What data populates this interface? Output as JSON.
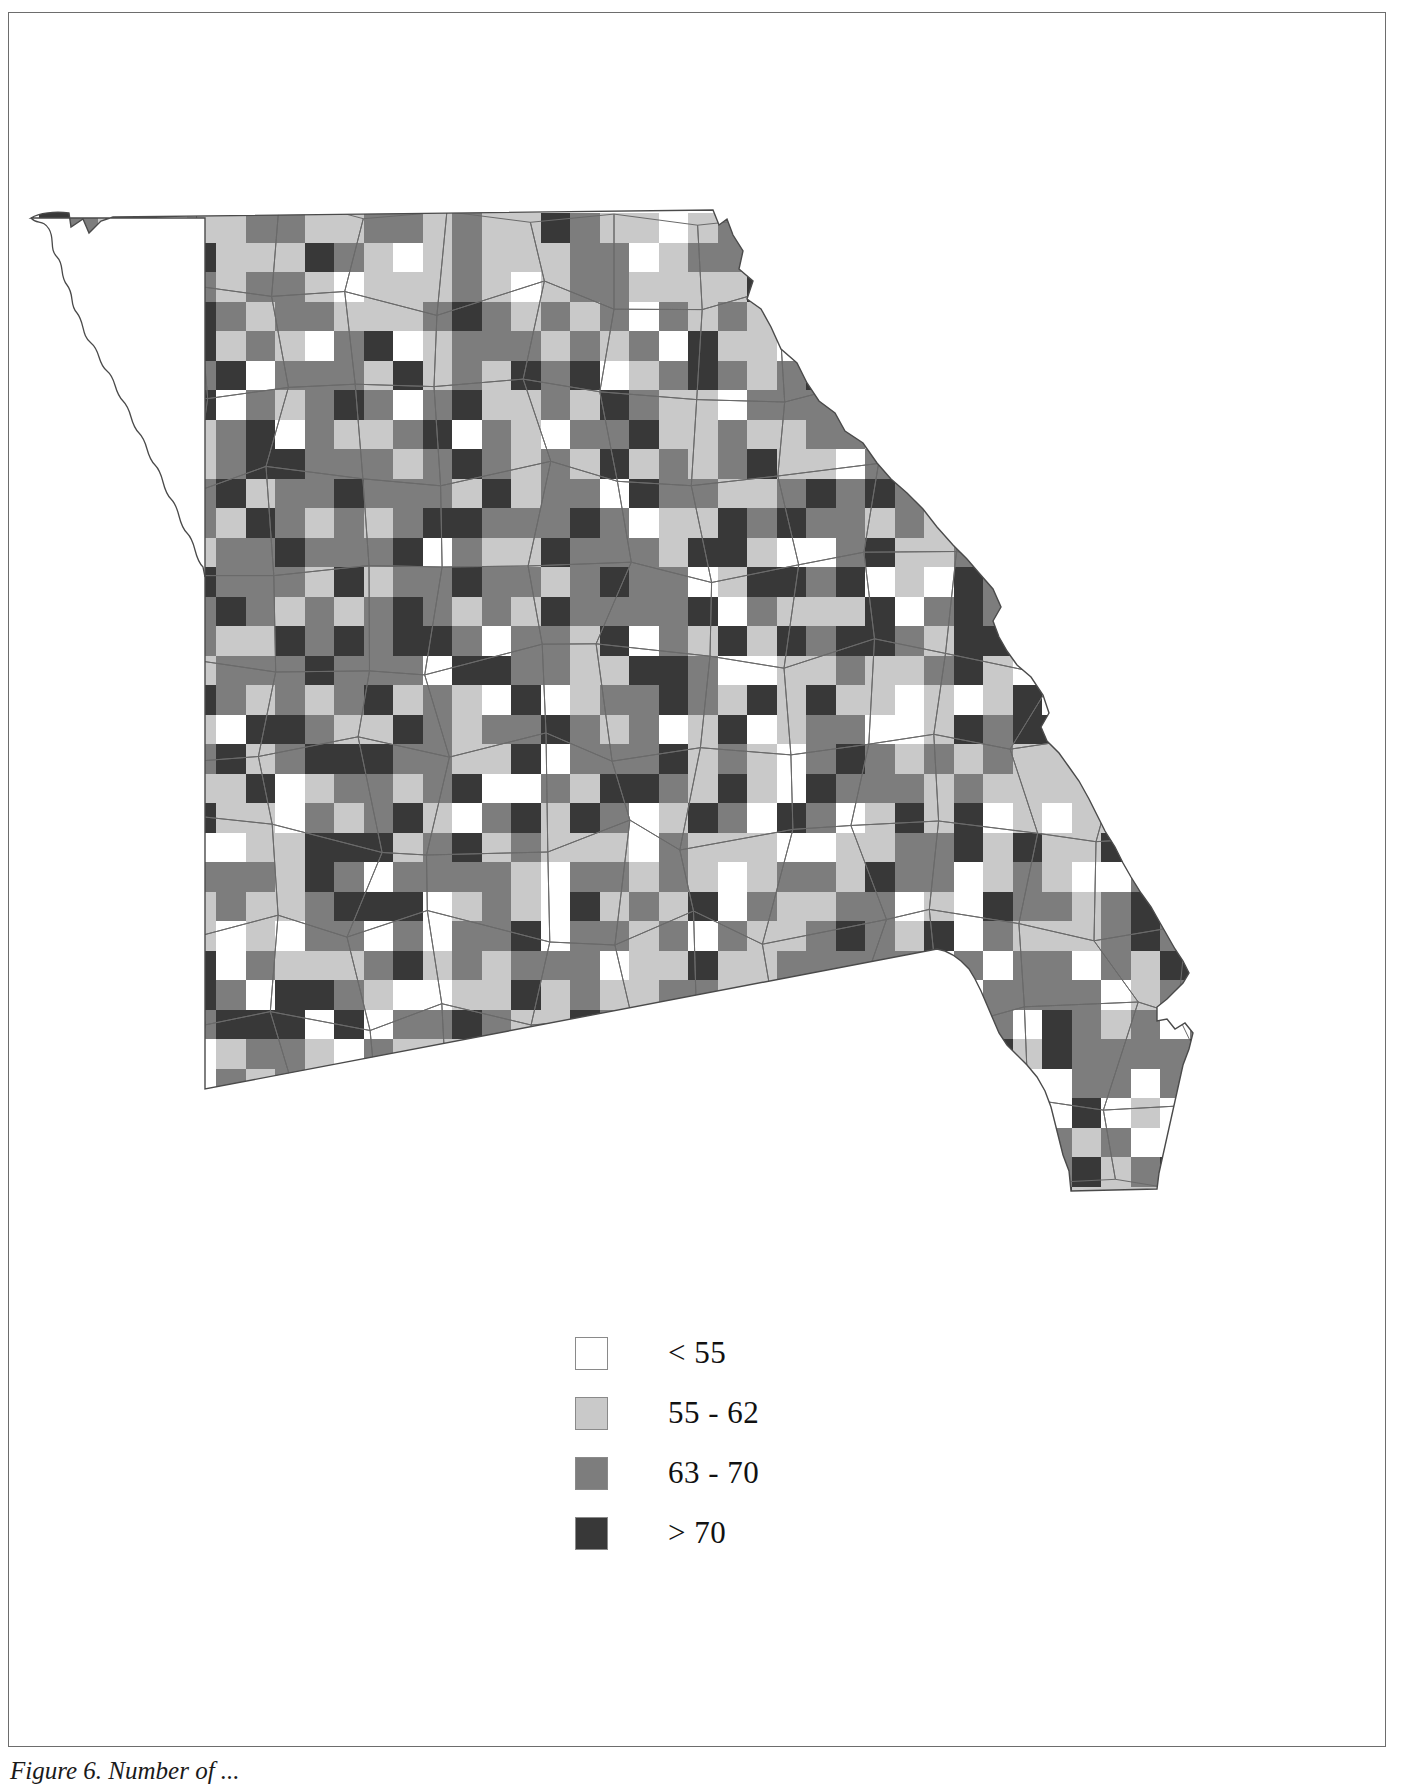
{
  "figure": {
    "caption": "Figure 6. Number of ...",
    "kind": "choropleth-grid-map",
    "region": "Missouri"
  },
  "legend": {
    "title": "",
    "items": [
      {
        "label": "< 55",
        "color": "#ffffff",
        "swatch_name": "legend-swatch-lt55"
      },
      {
        "label": "55 - 62",
        "color": "#c9c9c9",
        "swatch_name": "legend-swatch-55-62"
      },
      {
        "label": "63 - 70",
        "color": "#7d7d7d",
        "swatch_name": "legend-swatch-63-70"
      },
      {
        "label": "> 70",
        "color": "#383838",
        "swatch_name": "legend-swatch-gt70"
      }
    ]
  },
  "chart_data": {
    "type": "heatmap",
    "title": "",
    "xlabel": "",
    "ylabel": "",
    "grid": true,
    "legend_position": "bottom-center",
    "class_colors": [
      "#ffffff",
      "#c9c9c9",
      "#7d7d7d",
      "#383838"
    ],
    "class_labels": [
      "< 55",
      "55 - 62",
      "63 - 70",
      "> 70"
    ],
    "cell_size_px": 29.5,
    "origin_px": [
      30,
      200
    ],
    "note": "Each grid cell is classified into one of four value bins shown in the legend.",
    "cells": [
      {
        "r": 0,
        "c": 2,
        "v": 1
      },
      {
        "r": 0,
        "c": 3,
        "v": 1
      },
      {
        "r": 0,
        "c": 5,
        "v": 1
      },
      {
        "r": 0,
        "c": 7,
        "v": 2
      },
      {
        "r": 0,
        "c": 9,
        "v": 1
      },
      {
        "r": 0,
        "c": 10,
        "v": 1
      },
      {
        "r": 0,
        "c": 12,
        "v": 2
      },
      {
        "r": 0,
        "c": 13,
        "v": 1
      },
      {
        "r": 0,
        "c": 15,
        "v": 1
      },
      {
        "r": 0,
        "c": 16,
        "v": 1
      },
      {
        "r": 0,
        "c": 18,
        "v": 2
      },
      {
        "r": 0,
        "c": 19,
        "v": 1
      },
      {
        "r": 0,
        "c": 20,
        "v": 1
      },
      {
        "r": 0,
        "c": 22,
        "v": 1
      },
      {
        "r": 1,
        "c": 1,
        "v": 1
      },
      {
        "r": 1,
        "c": 2,
        "v": 1
      },
      {
        "r": 1,
        "c": 3,
        "v": 2
      },
      {
        "r": 1,
        "c": 4,
        "v": 1
      },
      {
        "r": 1,
        "c": 6,
        "v": 1
      },
      {
        "r": 1,
        "c": 7,
        "v": 1
      },
      {
        "r": 1,
        "c": 8,
        "v": 1
      },
      {
        "r": 1,
        "c": 10,
        "v": 2
      },
      {
        "r": 1,
        "c": 11,
        "v": 1
      },
      {
        "r": 1,
        "c": 13,
        "v": 1
      },
      {
        "r": 1,
        "c": 14,
        "v": 2
      },
      {
        "r": 1,
        "c": 16,
        "v": 1
      },
      {
        "r": 1,
        "c": 17,
        "v": 1
      },
      {
        "r": 1,
        "c": 19,
        "v": 2
      },
      {
        "r": 1,
        "c": 21,
        "v": 1
      },
      {
        "r": 1,
        "c": 23,
        "v": 2
      },
      {
        "r": 2,
        "c": 1,
        "v": 1
      },
      {
        "r": 2,
        "c": 2,
        "v": 2
      },
      {
        "r": 2,
        "c": 4,
        "v": 1
      },
      {
        "r": 2,
        "c": 5,
        "v": 2
      },
      {
        "r": 2,
        "c": 6,
        "v": 1
      },
      {
        "r": 2,
        "c": 8,
        "v": 2
      },
      {
        "r": 2,
        "c": 9,
        "v": 1
      },
      {
        "r": 2,
        "c": 11,
        "v": 1
      },
      {
        "r": 2,
        "c": 12,
        "v": 1
      },
      {
        "r": 2,
        "c": 14,
        "v": 2
      },
      {
        "r": 2,
        "c": 15,
        "v": 1
      },
      {
        "r": 2,
        "c": 17,
        "v": 1
      },
      {
        "r": 2,
        "c": 18,
        "v": 2
      },
      {
        "r": 2,
        "c": 20,
        "v": 1
      },
      {
        "r": 2,
        "c": 22,
        "v": 1
      },
      {
        "r": 2,
        "c": 23,
        "v": 1
      },
      {
        "r": 3,
        "c": 2,
        "v": 1
      },
      {
        "r": 3,
        "c": 3,
        "v": 2
      },
      {
        "r": 3,
        "c": 5,
        "v": 3
      },
      {
        "r": 3,
        "c": 6,
        "v": 2
      },
      {
        "r": 3,
        "c": 7,
        "v": 1
      },
      {
        "r": 3,
        "c": 9,
        "v": 2
      },
      {
        "r": 3,
        "c": 10,
        "v": 1
      },
      {
        "r": 3,
        "c": 12,
        "v": 1
      },
      {
        "r": 3,
        "c": 13,
        "v": 2
      },
      {
        "r": 3,
        "c": 15,
        "v": 2
      },
      {
        "r": 3,
        "c": 16,
        "v": 1
      },
      {
        "r": 3,
        "c": 18,
        "v": 1
      },
      {
        "r": 3,
        "c": 19,
        "v": 2
      },
      {
        "r": 3,
        "c": 21,
        "v": 2
      },
      {
        "r": 3,
        "c": 22,
        "v": 1
      },
      {
        "r": 3,
        "c": 24,
        "v": 1
      },
      {
        "r": 4,
        "c": 1,
        "v": 1
      },
      {
        "r": 4,
        "c": 3,
        "v": 1
      },
      {
        "r": 4,
        "c": 4,
        "v": 2
      },
      {
        "r": 4,
        "c": 5,
        "v": 3
      },
      {
        "r": 4,
        "c": 7,
        "v": 2
      },
      {
        "r": 4,
        "c": 8,
        "v": 1
      },
      {
        "r": 4,
        "c": 10,
        "v": 2
      },
      {
        "r": 4,
        "c": 11,
        "v": 3
      },
      {
        "r": 4,
        "c": 13,
        "v": 1
      },
      {
        "r": 4,
        "c": 14,
        "v": 2
      },
      {
        "r": 4,
        "c": 16,
        "v": 2
      },
      {
        "r": 4,
        "c": 17,
        "v": 1
      },
      {
        "r": 4,
        "c": 19,
        "v": 1
      },
      {
        "r": 4,
        "c": 20,
        "v": 2
      },
      {
        "r": 4,
        "c": 22,
        "v": 3
      },
      {
        "r": 4,
        "c": 23,
        "v": 1
      },
      {
        "r": 5,
        "c": 2,
        "v": 2
      },
      {
        "r": 5,
        "c": 3,
        "v": 1
      },
      {
        "r": 5,
        "c": 5,
        "v": 2
      },
      {
        "r": 5,
        "c": 6,
        "v": 3
      },
      {
        "r": 5,
        "c": 8,
        "v": 2
      },
      {
        "r": 5,
        "c": 9,
        "v": 2
      },
      {
        "r": 5,
        "c": 11,
        "v": 1
      },
      {
        "r": 5,
        "c": 12,
        "v": 3
      },
      {
        "r": 5,
        "c": 14,
        "v": 2
      },
      {
        "r": 5,
        "c": 15,
        "v": 1
      },
      {
        "r": 5,
        "c": 17,
        "v": 2
      },
      {
        "r": 5,
        "c": 18,
        "v": 3
      },
      {
        "r": 5,
        "c": 20,
        "v": 1
      },
      {
        "r": 5,
        "c": 21,
        "v": 2
      },
      {
        "r": 5,
        "c": 23,
        "v": 2
      },
      {
        "r": 5,
        "c": 24,
        "v": 1
      },
      {
        "r": 6,
        "c": 0,
        "v": 3
      },
      {
        "r": 6,
        "c": 2,
        "v": 1
      },
      {
        "r": 6,
        "c": 4,
        "v": 2
      },
      {
        "r": 6,
        "c": 5,
        "v": 3
      },
      {
        "r": 6,
        "c": 7,
        "v": 2
      },
      {
        "r": 6,
        "c": 8,
        "v": 1
      },
      {
        "r": 6,
        "c": 10,
        "v": 3
      },
      {
        "r": 6,
        "c": 11,
        "v": 2
      },
      {
        "r": 6,
        "c": 13,
        "v": 2
      },
      {
        "r": 6,
        "c": 14,
        "v": 3
      },
      {
        "r": 6,
        "c": 16,
        "v": 1
      },
      {
        "r": 6,
        "c": 17,
        "v": 2
      },
      {
        "r": 6,
        "c": 19,
        "v": 3
      },
      {
        "r": 6,
        "c": 20,
        "v": 2
      },
      {
        "r": 6,
        "c": 22,
        "v": 1
      },
      {
        "r": 6,
        "c": 24,
        "v": 2
      },
      {
        "r": 7,
        "c": 1,
        "v": 2
      },
      {
        "r": 7,
        "c": 3,
        "v": 3
      },
      {
        "r": 7,
        "c": 4,
        "v": 1
      },
      {
        "r": 7,
        "c": 6,
        "v": 2
      },
      {
        "r": 7,
        "c": 7,
        "v": 3
      },
      {
        "r": 7,
        "c": 9,
        "v": 2
      },
      {
        "r": 7,
        "c": 10,
        "v": 1
      },
      {
        "r": 7,
        "c": 12,
        "v": 2
      },
      {
        "r": 7,
        "c": 13,
        "v": 3
      },
      {
        "r": 7,
        "c": 15,
        "v": 2
      },
      {
        "r": 7,
        "c": 16,
        "v": 1
      },
      {
        "r": 7,
        "c": 18,
        "v": 2
      },
      {
        "r": 7,
        "c": 20,
        "v": 3
      },
      {
        "r": 7,
        "c": 21,
        "v": 1
      },
      {
        "r": 7,
        "c": 23,
        "v": 2
      },
      {
        "r": 7,
        "c": 25,
        "v": 1
      },
      {
        "r": 8,
        "c": 0,
        "v": 2
      },
      {
        "r": 8,
        "c": 2,
        "v": 3
      },
      {
        "r": 8,
        "c": 3,
        "v": 2
      },
      {
        "r": 8,
        "c": 5,
        "v": 1
      },
      {
        "r": 8,
        "c": 6,
        "v": 2
      },
      {
        "r": 8,
        "c": 8,
        "v": 3
      },
      {
        "r": 8,
        "c": 9,
        "v": 2
      },
      {
        "r": 8,
        "c": 11,
        "v": 2
      },
      {
        "r": 8,
        "c": 12,
        "v": 1
      },
      {
        "r": 8,
        "c": 14,
        "v": 3
      },
      {
        "r": 8,
        "c": 15,
        "v": 2
      },
      {
        "r": 8,
        "c": 17,
        "v": 2
      },
      {
        "r": 8,
        "c": 19,
        "v": 3
      },
      {
        "r": 8,
        "c": 21,
        "v": 2
      },
      {
        "r": 8,
        "c": 22,
        "v": 1
      },
      {
        "r": 8,
        "c": 24,
        "v": 3
      },
      {
        "r": 9,
        "c": 1,
        "v": 3
      },
      {
        "r": 9,
        "c": 2,
        "v": 2
      },
      {
        "r": 9,
        "c": 4,
        "v": 2
      },
      {
        "r": 9,
        "c": 6,
        "v": 3
      },
      {
        "r": 9,
        "c": 7,
        "v": 1
      },
      {
        "r": 9,
        "c": 9,
        "v": 2
      },
      {
        "r": 9,
        "c": 10,
        "v": 3
      },
      {
        "r": 9,
        "c": 12,
        "v": 2
      },
      {
        "r": 9,
        "c": 14,
        "v": 1
      },
      {
        "r": 9,
        "c": 15,
        "v": 3
      },
      {
        "r": 9,
        "c": 17,
        "v": 2
      },
      {
        "r": 9,
        "c": 18,
        "v": 2
      },
      {
        "r": 9,
        "c": 20,
        "v": 3
      },
      {
        "r": 9,
        "c": 22,
        "v": 2
      },
      {
        "r": 9,
        "c": 23,
        "v": 1
      },
      {
        "r": 9,
        "c": 25,
        "v": 2
      },
      {
        "r": 10,
        "c": 0,
        "v": 2
      },
      {
        "r": 10,
        "c": 2,
        "v": 3
      },
      {
        "r": 10,
        "c": 4,
        "v": 1
      },
      {
        "r": 10,
        "c": 5,
        "v": 2
      },
      {
        "r": 10,
        "c": 7,
        "v": 3
      },
      {
        "r": 10,
        "c": 8,
        "v": 2
      },
      {
        "r": 10,
        "c": 10,
        "v": 2
      },
      {
        "r": 10,
        "c": 11,
        "v": 1
      },
      {
        "r": 10,
        "c": 13,
        "v": 3
      },
      {
        "r": 10,
        "c": 16,
        "v": 2
      },
      {
        "r": 10,
        "c": 18,
        "v": 3
      },
      {
        "r": 10,
        "c": 19,
        "v": 2
      },
      {
        "r": 10,
        "c": 21,
        "v": 1
      },
      {
        "r": 10,
        "c": 23,
        "v": 3
      },
      {
        "r": 10,
        "c": 24,
        "v": 2
      },
      {
        "r": 11,
        "c": 1,
        "v": 2
      },
      {
        "r": 11,
        "c": 3,
        "v": 3
      },
      {
        "r": 11,
        "c": 5,
        "v": 1
      },
      {
        "r": 11,
        "c": 6,
        "v": 2
      },
      {
        "r": 11,
        "c": 8,
        "v": 3
      },
      {
        "r": 11,
        "c": 9,
        "v": 2
      },
      {
        "r": 11,
        "c": 11,
        "v": 2
      },
      {
        "r": 11,
        "c": 12,
        "v": 3
      },
      {
        "r": 11,
        "c": 14,
        "v": 2
      },
      {
        "r": 11,
        "c": 15,
        "v": 1
      },
      {
        "r": 11,
        "c": 17,
        "v": 3
      },
      {
        "r": 11,
        "c": 19,
        "v": 2
      },
      {
        "r": 11,
        "c": 20,
        "v": 2
      },
      {
        "r": 11,
        "c": 22,
        "v": 3
      },
      {
        "r": 11,
        "c": 24,
        "v": 1
      },
      {
        "r": 12,
        "c": 0,
        "v": 3
      },
      {
        "r": 12,
        "c": 2,
        "v": 2
      },
      {
        "r": 12,
        "c": 3,
        "v": 1
      },
      {
        "r": 12,
        "c": 5,
        "v": 3
      },
      {
        "r": 12,
        "c": 7,
        "v": 2
      },
      {
        "r": 12,
        "c": 8,
        "v": 2
      },
      {
        "r": 12,
        "c": 10,
        "v": 3
      },
      {
        "r": 12,
        "c": 11,
        "v": 1
      },
      {
        "r": 12,
        "c": 13,
        "v": 2
      },
      {
        "r": 12,
        "c": 14,
        "v": 3
      },
      {
        "r": 12,
        "c": 16,
        "v": 2
      },
      {
        "r": 12,
        "c": 18,
        "v": 2
      },
      {
        "r": 12,
        "c": 19,
        "v": 3
      },
      {
        "r": 12,
        "c": 21,
        "v": 2
      },
      {
        "r": 12,
        "c": 23,
        "v": 1
      },
      {
        "r": 12,
        "c": 25,
        "v": 3
      },
      {
        "r": 13,
        "c": 1,
        "v": 1
      },
      {
        "r": 13,
        "c": 2,
        "v": 3
      },
      {
        "r": 13,
        "c": 4,
        "v": 2
      },
      {
        "r": 13,
        "c": 6,
        "v": 3
      },
      {
        "r": 13,
        "c": 7,
        "v": 2
      },
      {
        "r": 13,
        "c": 9,
        "v": 2
      },
      {
        "r": 13,
        "c": 10,
        "v": 1
      },
      {
        "r": 13,
        "c": 12,
        "v": 3
      },
      {
        "r": 13,
        "c": 15,
        "v": 2
      },
      {
        "r": 13,
        "c": 17,
        "v": 3
      },
      {
        "r": 13,
        "c": 18,
        "v": 2
      },
      {
        "r": 13,
        "c": 20,
        "v": 2
      },
      {
        "r": 13,
        "c": 22,
        "v": 3
      },
      {
        "r": 13,
        "c": 24,
        "v": 2
      },
      {
        "r": 14,
        "c": 0,
        "v": 2
      },
      {
        "r": 14,
        "c": 3,
        "v": 3
      },
      {
        "r": 14,
        "c": 5,
        "v": 2
      },
      {
        "r": 14,
        "c": 6,
        "v": 1
      },
      {
        "r": 14,
        "c": 8,
        "v": 3
      },
      {
        "r": 14,
        "c": 11,
        "v": 2
      },
      {
        "r": 14,
        "c": 13,
        "v": 3
      },
      {
        "r": 14,
        "c": 14,
        "v": 2
      },
      {
        "r": 14,
        "c": 16,
        "v": 2
      },
      {
        "r": 14,
        "c": 19,
        "v": 3
      },
      {
        "r": 14,
        "c": 21,
        "v": 2
      },
      {
        "r": 14,
        "c": 23,
        "v": 3
      },
      {
        "r": 15,
        "c": 1,
        "v": 3
      },
      {
        "r": 15,
        "c": 2,
        "v": 2
      },
      {
        "r": 15,
        "c": 4,
        "v": 3
      },
      {
        "r": 15,
        "c": 7,
        "v": 2
      },
      {
        "r": 15,
        "c": 9,
        "v": 3
      },
      {
        "r": 15,
        "c": 10,
        "v": 2
      },
      {
        "r": 15,
        "c": 12,
        "v": 2
      },
      {
        "r": 15,
        "c": 15,
        "v": 3
      },
      {
        "r": 15,
        "c": 17,
        "v": 2
      },
      {
        "r": 15,
        "c": 18,
        "v": 1
      },
      {
        "r": 15,
        "c": 20,
        "v": 3
      },
      {
        "r": 15,
        "c": 22,
        "v": 2
      },
      {
        "r": 16,
        "c": 0,
        "v": 3
      },
      {
        "r": 16,
        "c": 2,
        "v": 2
      },
      {
        "r": 16,
        "c": 5,
        "v": 3
      },
      {
        "r": 16,
        "c": 6,
        "v": 2
      },
      {
        "r": 16,
        "c": 8,
        "v": 2
      },
      {
        "r": 16,
        "c": 11,
        "v": 3
      },
      {
        "r": 16,
        "c": 13,
        "v": 2
      },
      {
        "r": 16,
        "c": 14,
        "v": 1
      },
      {
        "r": 16,
        "c": 16,
        "v": 3
      },
      {
        "r": 16,
        "c": 19,
        "v": 2
      },
      {
        "r": 16,
        "c": 21,
        "v": 3
      },
      {
        "r": 17,
        "c": 1,
        "v": 2
      },
      {
        "r": 17,
        "c": 3,
        "v": 3
      },
      {
        "r": 17,
        "c": 4,
        "v": 2
      },
      {
        "r": 17,
        "c": 7,
        "v": 3
      },
      {
        "r": 17,
        "c": 9,
        "v": 2
      },
      {
        "r": 17,
        "c": 12,
        "v": 3
      },
      {
        "r": 17,
        "c": 15,
        "v": 2
      },
      {
        "r": 17,
        "c": 17,
        "v": 3
      },
      {
        "r": 17,
        "c": 20,
        "v": 2
      },
      {
        "r": 17,
        "c": 22,
        "v": 1
      },
      {
        "r": 18,
        "c": 0,
        "v": 3
      },
      {
        "r": 18,
        "c": 2,
        "v": 2
      },
      {
        "r": 18,
        "c": 6,
        "v": 3
      },
      {
        "r": 18,
        "c": 8,
        "v": 2
      },
      {
        "r": 18,
        "c": 10,
        "v": 3
      },
      {
        "r": 18,
        "c": 13,
        "v": 2
      },
      {
        "r": 18,
        "c": 16,
        "v": 3
      },
      {
        "r": 18,
        "c": 18,
        "v": 2
      },
      {
        "r": 18,
        "c": 21,
        "v": 3
      },
      {
        "r": 19,
        "c": 1,
        "v": 3
      },
      {
        "r": 19,
        "c": 4,
        "v": 2
      },
      {
        "r": 19,
        "c": 7,
        "v": 3
      },
      {
        "r": 19,
        "c": 11,
        "v": 2
      },
      {
        "r": 19,
        "c": 14,
        "v": 3
      },
      {
        "r": 19,
        "c": 17,
        "v": 2
      },
      {
        "r": 19,
        "c": 19,
        "v": 3
      },
      {
        "r": 20,
        "c": 0,
        "v": 3
      },
      {
        "r": 20,
        "c": 3,
        "v": 2
      },
      {
        "r": 20,
        "c": 5,
        "v": 3
      },
      {
        "r": 20,
        "c": 9,
        "v": 2
      },
      {
        "r": 20,
        "c": 12,
        "v": 3
      },
      {
        "r": 20,
        "c": 15,
        "v": 2
      },
      {
        "r": 20,
        "c": 18,
        "v": 3
      }
    ]
  }
}
